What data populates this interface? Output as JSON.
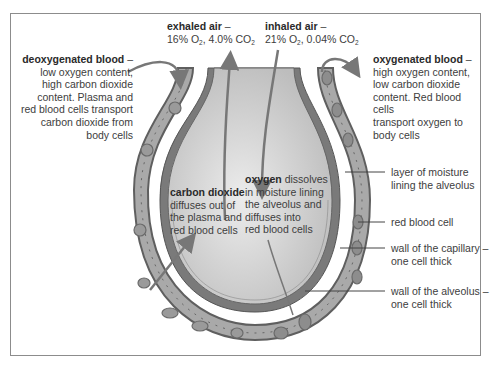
{
  "diagram": {
    "colors": {
      "frame": "#8c8c8c",
      "capillary_wall": "#6e6e6e",
      "capillary_blood": "#a9a9a9",
      "alveolus_wall": "#7a7a7a",
      "alveolus_air": "#d6d6d6",
      "arrow": "#777777",
      "text": "#3d3d3d"
    },
    "labels": {
      "exhaled_air": {
        "title": "exhaled air",
        "dash": " –",
        "o2": "16% O",
        "o2_sub": "2",
        "sep": ", 4.0% CO",
        "co2_sub": "2"
      },
      "inhaled_air": {
        "title": "inhaled air",
        "dash": " –",
        "o2": "21% O",
        "o2_sub": "2",
        "sep": ", 0.04% CO",
        "co2_sub": "2"
      },
      "deoxygenated_blood": {
        "title": "deoxygenated blood",
        "dash": " –",
        "lines": [
          "low oxygen content,",
          "high carbon dioxide",
          "content. Plasma and",
          "red blood cells transport",
          "carbon dioxide from",
          "body cells"
        ]
      },
      "oxygenated_blood": {
        "title": "oxygenated blood",
        "dash": " –",
        "lines": [
          "high oxygen content,",
          "low carbon dioxide",
          "content. Red blood cells",
          "transport oxygen to",
          "body cells"
        ]
      },
      "carbon_dioxide": {
        "title": "carbon dioxide",
        "lines": [
          "diffuses out of",
          "the plasma and",
          "red blood cells"
        ]
      },
      "oxygen": {
        "title": "oxygen",
        "first_line_rest": " dissolves",
        "lines": [
          "in moisture lining",
          "the alveolus and",
          "diffuses into",
          "red blood cells"
        ]
      },
      "moisture_layer": {
        "lines": [
          "layer of moisture",
          "lining the alveolus"
        ]
      },
      "red_blood_cell": {
        "lines": [
          "red blood cell"
        ]
      },
      "capillary_wall": {
        "lines": [
          "wall of the capillary –",
          "one cell thick"
        ]
      },
      "alveolus_wall": {
        "lines": [
          "wall of the alveolus –",
          "one cell thick"
        ]
      }
    }
  }
}
